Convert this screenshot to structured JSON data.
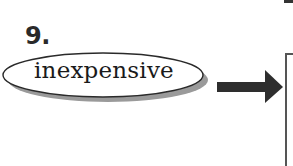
{
  "item": {
    "number": "9.",
    "word": "inexpensive"
  },
  "icons": {
    "arrow": "right-arrow-icon"
  },
  "colors": {
    "ink": "#1a1a1a",
    "oval_shadow": "#9a9a9a",
    "arrow": "#2e2e2e",
    "box_border": "#555555"
  }
}
